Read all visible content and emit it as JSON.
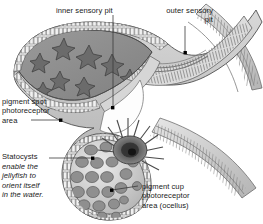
{
  "figure": {
    "kind": "anatomical-diagram",
    "style": "grayscale pen-and-ink shaded illustration",
    "background_color": "#ffffff",
    "palette": {
      "outline": "#4a4a4a",
      "dark_tissue": "#6e6e6e",
      "mid_gray": "#8d8d8d",
      "light_gray": "#c9c9c9",
      "pale_gray": "#e2e2e2",
      "lumen_white": "#fdfdfd",
      "text": "#1a1a1a",
      "leader_line": "#3a3a3a",
      "dot": "#000000"
    }
  },
  "labels": [
    {
      "id": "inner-sensory-pit",
      "text": "inner sensory pit",
      "align": "left",
      "leader": {
        "type": "vertical",
        "from": [
          113,
          15
        ],
        "to": [
          113,
          107
        ]
      },
      "dot": [
        113,
        108
      ]
    },
    {
      "id": "outer-sensory-pit",
      "text": "outer sensory\npit",
      "align": "right",
      "leader": {
        "type": "vertical",
        "from": [
          185,
          26
        ],
        "to": [
          185,
          52
        ]
      },
      "dot": [
        185,
        53
      ]
    },
    {
      "id": "pigment-spot-photoreceptor-area",
      "text": "pigment spot\nphotoreceptor\narea",
      "align": "left",
      "leader": {
        "type": "horizontal",
        "from": [
          31,
          120
        ],
        "to": [
          60,
          120
        ]
      },
      "dot": [
        61,
        120
      ]
    },
    {
      "id": "statocysts",
      "text": "Statocysts",
      "subtext": "enable the\njellyfish to\norient itself\nin the water.",
      "subtext_style": "italic",
      "align": "left",
      "leader": {
        "type": "horizontal",
        "from": [
          49,
          158
        ],
        "to": [
          92,
          158
        ]
      },
      "dot": [
        93,
        158
      ]
    },
    {
      "id": "pigment-cup-photoreceptor-area",
      "text": "pigment cup\nphotoreceptor\narea (ocellus)",
      "align": "left",
      "leader": {
        "type": "diagonal",
        "from": [
          113,
          190
        ],
        "to": [
          138,
          186
        ]
      },
      "dot": [
        112,
        190
      ]
    }
  ],
  "structures": [
    {
      "name": "inner sensory pit chamber",
      "description": "large gray lens-shaped cavity containing star-shaped pigment cells, bounded by columnar epithelium"
    },
    {
      "name": "star cells",
      "count": 8,
      "description": "dark stellate pigment cells scattered within the inner pit chamber"
    },
    {
      "name": "outer sensory pit",
      "description": "ciliated trough at upper right lined with fine hair-like projections"
    },
    {
      "name": "pigment spot photoreceptor area",
      "description": "band of columnar epithelium forming the upper-left pit wall"
    },
    {
      "name": "statocyst sac",
      "description": "bulbous sac at lower center packed with rounded statolith concretions"
    },
    {
      "name": "statoliths",
      "count": 26,
      "description": "rounded crystalline concretions filling the statocyst"
    },
    {
      "name": "pigment cup ocellus",
      "description": "radiating dark pigment cup with a central dark core at the statocyst neck"
    },
    {
      "name": "epithelial bands",
      "description": "curved striated tissue bands sweeping to the upper and lower right margins"
    }
  ]
}
